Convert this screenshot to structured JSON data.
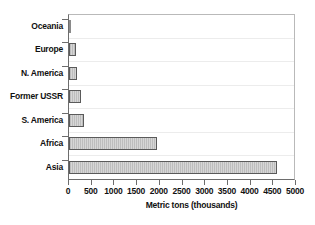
{
  "chart_data": {
    "type": "bar",
    "orientation": "horizontal",
    "title": "",
    "xlabel": "Metric tons (thousands)",
    "ylabel": "",
    "categories": [
      "Oceania",
      "Europe",
      "N. America",
      "Former USSR",
      "S. America",
      "Africa",
      "Asia"
    ],
    "values": [
      25,
      155,
      180,
      265,
      330,
      1940,
      4580
    ],
    "xlim": [
      0,
      5000
    ],
    "xticks": [
      0,
      500,
      1000,
      1500,
      2000,
      2500,
      3000,
      3500,
      4000,
      4500,
      5000
    ],
    "xtick_labels": [
      "0",
      "500",
      "1000",
      "1500",
      "2000",
      "2500",
      "3000",
      "3500",
      "4000",
      "4500",
      "5000"
    ],
    "grid": false,
    "legend": "none",
    "bar_fill_color": "#c6c6c6",
    "bar_edge_color": "#5a5a5a",
    "axis_color": "#6d6d6d",
    "background_color": "#ffffff"
  }
}
